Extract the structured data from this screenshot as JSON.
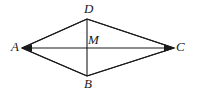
{
  "figure": {
    "kind": "geometry-diagram",
    "shape": "rhombus",
    "background_color": "#ffffff",
    "stroke_color": "#1a1a1a",
    "label_color": "#1a1a1a",
    "canvas": {
      "width": 197,
      "height": 93
    },
    "vertices": [
      {
        "name": "D",
        "label": "D",
        "x": 87,
        "y": 19,
        "label_x": 84,
        "label_y": 2
      },
      {
        "name": "A",
        "label": "A",
        "x": 22,
        "y": 48,
        "label_x": 11,
        "label_y": 40
      },
      {
        "name": "C",
        "label": "C",
        "x": 174,
        "y": 48,
        "label_x": 176,
        "label_y": 40
      },
      {
        "name": "B",
        "label": "B",
        "x": 87,
        "y": 76,
        "label_x": 84,
        "label_y": 77
      }
    ],
    "intersection": {
      "name": "M",
      "label": "M",
      "x": 87,
      "y": 48,
      "label_x": 88,
      "label_y": 33
    },
    "sides": [
      {
        "name": "AD",
        "from": "A",
        "to": "D"
      },
      {
        "name": "DC",
        "from": "D",
        "to": "C"
      },
      {
        "name": "CB",
        "from": "C",
        "to": "B"
      },
      {
        "name": "BA",
        "from": "B",
        "to": "A"
      }
    ],
    "diagonals": [
      {
        "name": "AC",
        "from": "A",
        "to": "C",
        "arrowheads": "both"
      },
      {
        "name": "DB",
        "from": "D",
        "to": "B",
        "arrowheads": "none"
      }
    ]
  }
}
